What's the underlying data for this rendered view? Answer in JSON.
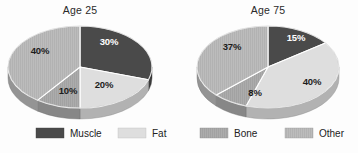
{
  "figure": {
    "background": "#fdfdfd",
    "style": "grayscale scanned textbook figure, two 3-D exploded-free pie charts side by side"
  },
  "chart_data": [
    {
      "type": "pie",
      "title": "Age 25",
      "categories": [
        "Muscle",
        "Fat",
        "Bone",
        "Other"
      ],
      "values": [
        30,
        20,
        10,
        40
      ],
      "labels": [
        "30%",
        "20%",
        "10%",
        "40%"
      ],
      "colors": [
        "#4a4a4a",
        "#dedede",
        "#a9a9a9",
        "#b9b9b9"
      ],
      "label_text_colors": [
        "#ffffff",
        "#1c1c1c",
        "#1c1c1c",
        "#1c1c1c"
      ],
      "start_angle_deg": 0,
      "direction": "clockwise",
      "three_d": true,
      "legend_position": "bottom",
      "xlabel": "",
      "ylabel": ""
    },
    {
      "type": "pie",
      "title": "Age 75",
      "categories": [
        "Muscle",
        "Fat",
        "Bone",
        "Other"
      ],
      "values": [
        15,
        40,
        8,
        37
      ],
      "labels": [
        "15%",
        "40%",
        "8%",
        "37%"
      ],
      "colors": [
        "#4a4a4a",
        "#dedede",
        "#a9a9a9",
        "#b9b9b9"
      ],
      "label_text_colors": [
        "#ffffff",
        "#1c1c1c",
        "#1c1c1c",
        "#1c1c1c"
      ],
      "start_angle_deg": 0,
      "direction": "clockwise",
      "three_d": true,
      "legend_position": "bottom",
      "xlabel": "",
      "ylabel": ""
    }
  ],
  "charts": [
    {
      "title": "Age 25",
      "cx": 80,
      "cy": 67,
      "rx": 72,
      "ry": 41,
      "depth": 11,
      "title_x": 80,
      "title_y": 14,
      "slices": [
        {
          "name": "Muscle",
          "value": 30,
          "label": "30%",
          "color": "#4a4a4a",
          "label_color": "#ffffff",
          "label_x": 109,
          "label_y": 45
        },
        {
          "name": "Fat",
          "value": 20,
          "label": "20%",
          "color": "#dedede",
          "label_color": "#1c1c1c",
          "label_x": 104,
          "label_y": 88
        },
        {
          "name": "Bone",
          "value": 10,
          "label": "10%",
          "color": "#a9a9a9",
          "label_color": "#1c1c1c",
          "label_x": 68,
          "label_y": 94
        },
        {
          "name": "Other",
          "value": 40,
          "label": "40%",
          "color": "#b9b9b9",
          "label_color": "#1c1c1c",
          "label_x": 40,
          "label_y": 54
        }
      ]
    },
    {
      "title": "Age 75",
      "cx": 268,
      "cy": 67,
      "rx": 71,
      "ry": 41,
      "depth": 11,
      "title_x": 268,
      "title_y": 14,
      "slices": [
        {
          "name": "Muscle",
          "value": 15,
          "label": "15%",
          "color": "#4a4a4a",
          "label_color": "#ffffff",
          "label_x": 296,
          "label_y": 41
        },
        {
          "name": "Fat",
          "value": 40,
          "label": "40%",
          "color": "#dedede",
          "label_color": "#1c1c1c",
          "label_x": 312,
          "label_y": 85
        },
        {
          "name": "Bone",
          "value": 8,
          "label": "8%",
          "color": "#a9a9a9",
          "label_color": "#1c1c1c",
          "label_x": 255,
          "label_y": 96
        },
        {
          "name": "Other",
          "value": 37,
          "label": "37%",
          "color": "#b9b9b9",
          "label_color": "#1c1c1c",
          "label_x": 232,
          "label_y": 50
        }
      ]
    }
  ],
  "legend": {
    "y": 128,
    "swatch_width": 28,
    "swatch_height": 10,
    "items": [
      {
        "label": "Muscle",
        "color": "#4a4a4a",
        "swatch_x": 36,
        "label_x": 70
      },
      {
        "label": "Fat",
        "color": "#dedede",
        "swatch_x": 118,
        "label_x": 152
      },
      {
        "label": "Bone",
        "color": "#a9a9a9",
        "swatch_x": 200,
        "label_x": 234
      },
      {
        "label": "Other",
        "color": "#b9b9b9",
        "swatch_x": 285,
        "label_x": 319
      }
    ]
  }
}
